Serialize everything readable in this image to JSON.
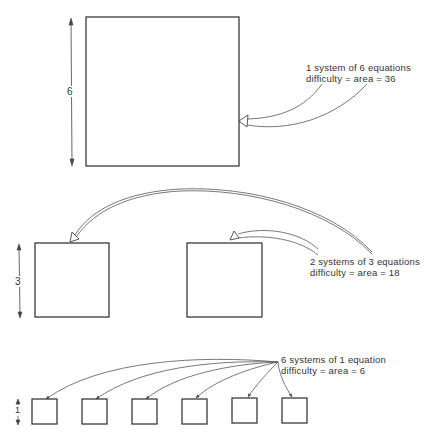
{
  "diagram": {
    "type": "area-difficulty-illustration",
    "sections": [
      {
        "id": "one-system",
        "dimension_label": "6",
        "box_count": 1,
        "box_side": 6,
        "caption_line1": "1 system of 6 equations",
        "caption_line2": "difficulty = area = 36"
      },
      {
        "id": "two-systems",
        "dimension_label": "3",
        "box_count": 2,
        "box_side": 3,
        "caption_line1": "2 systems of 3 equations",
        "caption_line2": "difficulty = area = 18"
      },
      {
        "id": "six-systems",
        "dimension_label": "1",
        "box_count": 6,
        "box_side": 1,
        "caption_line1": "6 systems of 1 equation",
        "caption_line2": "difficulty = area = 6"
      }
    ],
    "colors": {
      "line": "#3a3a3a",
      "background": "#ffffff"
    }
  }
}
